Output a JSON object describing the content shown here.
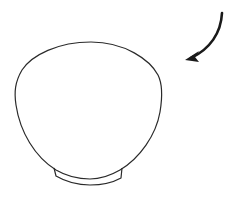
{
  "diagram": {
    "elements": [
      {
        "name": "bowl-body",
        "kind": "outline"
      },
      {
        "name": "foot-ring",
        "kind": "outline"
      },
      {
        "name": "curved-arrow",
        "kind": "arrow",
        "direction": "down-left"
      }
    ],
    "colors": {
      "stroke": "#2a2a2a",
      "arrow": "#1a1a1a",
      "background": "#ffffff"
    }
  }
}
